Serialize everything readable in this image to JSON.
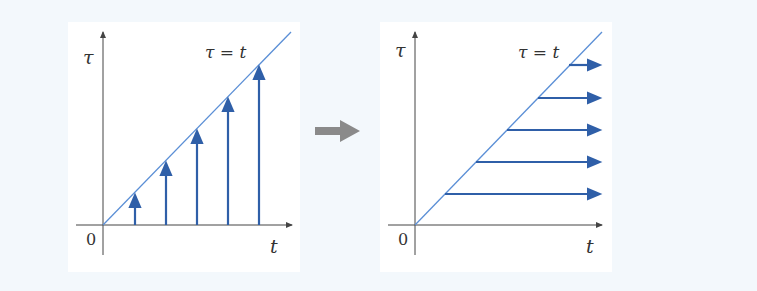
{
  "diagram": {
    "colors": {
      "background": "#f3f8fc",
      "axes": "#444444",
      "diagonal": "#5b8fd6",
      "arrows": "#2f5fa8",
      "transition_arrow": "#8a8a8a"
    },
    "left_panel": {
      "y_label": "τ",
      "x_label": "t",
      "origin_label": "0",
      "line_label": "τ = t",
      "arrow_direction": "vertical",
      "arrow_count": 5
    },
    "transition": {
      "icon": "right-arrow-icon"
    },
    "right_panel": {
      "y_label": "τ",
      "x_label": "t",
      "origin_label": "0",
      "line_label": "τ = t",
      "arrow_direction": "horizontal",
      "arrow_count": 5
    }
  }
}
